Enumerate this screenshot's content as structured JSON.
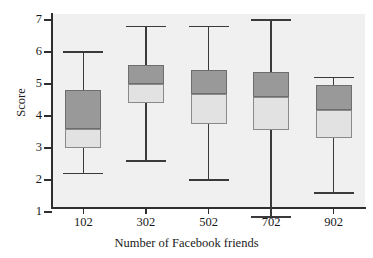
{
  "chart_data": {
    "type": "box",
    "title": "",
    "xlabel": "Number of Facebook friends",
    "ylabel": "Score",
    "categories": [
      "102",
      "302",
      "502",
      "702",
      "902"
    ],
    "yticks": [
      1,
      2,
      3,
      4,
      5,
      6,
      7
    ],
    "ylim": [
      0.6,
      7.4
    ],
    "grid": false,
    "legend": "none",
    "colors": {
      "upper_box_fill": "#999999",
      "lower_box_fill": "#e2e2e2",
      "box_edge": "#6d6d6d",
      "whisker": "#3a3a3a",
      "plot_background": "#f0f0f0",
      "axis": "#2e2e2e",
      "text": "#1a1a1a"
    },
    "boxes": [
      {
        "category": "102",
        "min": 2.2,
        "q1": 3.0,
        "median": 3.6,
        "q3": 4.8,
        "max": 6.0
      },
      {
        "category": "302",
        "min": 2.6,
        "q1": 4.4,
        "median": 5.0,
        "q3": 5.6,
        "max": 6.8
      },
      {
        "category": "502",
        "min": 2.0,
        "q1": 3.75,
        "median": 4.7,
        "q3": 5.45,
        "max": 6.8
      },
      {
        "category": "702",
        "min": 0.85,
        "q1": 3.55,
        "median": 4.6,
        "q3": 5.38,
        "max": 7.0
      },
      {
        "category": "902",
        "min": 1.6,
        "q1": 3.3,
        "median": 4.2,
        "q3": 4.97,
        "max": 5.2
      }
    ]
  },
  "axes": {
    "y_title": "Score",
    "x_title": "Number of Facebook friends",
    "y_tick_labels": [
      "7",
      "6",
      "5",
      "4",
      "3",
      "2",
      "1"
    ],
    "x_tick_labels": [
      "102",
      "302",
      "502",
      "702",
      "902"
    ]
  }
}
